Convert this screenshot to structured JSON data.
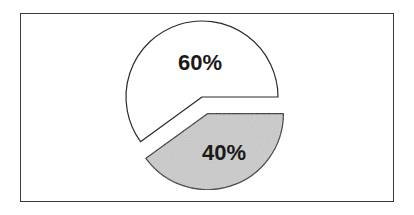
{
  "chart_data": {
    "type": "pie",
    "title": "",
    "categories": [
      "Slice A",
      "Slice B"
    ],
    "values": [
      60,
      40
    ],
    "labels": [
      "60%",
      "40%"
    ],
    "exploded": [
      false,
      true
    ],
    "colors": [
      "#ffffff",
      "#cccccc"
    ],
    "start_angle_deg": 0,
    "direction": "counterclockwise",
    "legend": "none",
    "frame": true
  },
  "style": {
    "stroke": "#2a2a2a",
    "frame_border": "#3a3a3a"
  }
}
